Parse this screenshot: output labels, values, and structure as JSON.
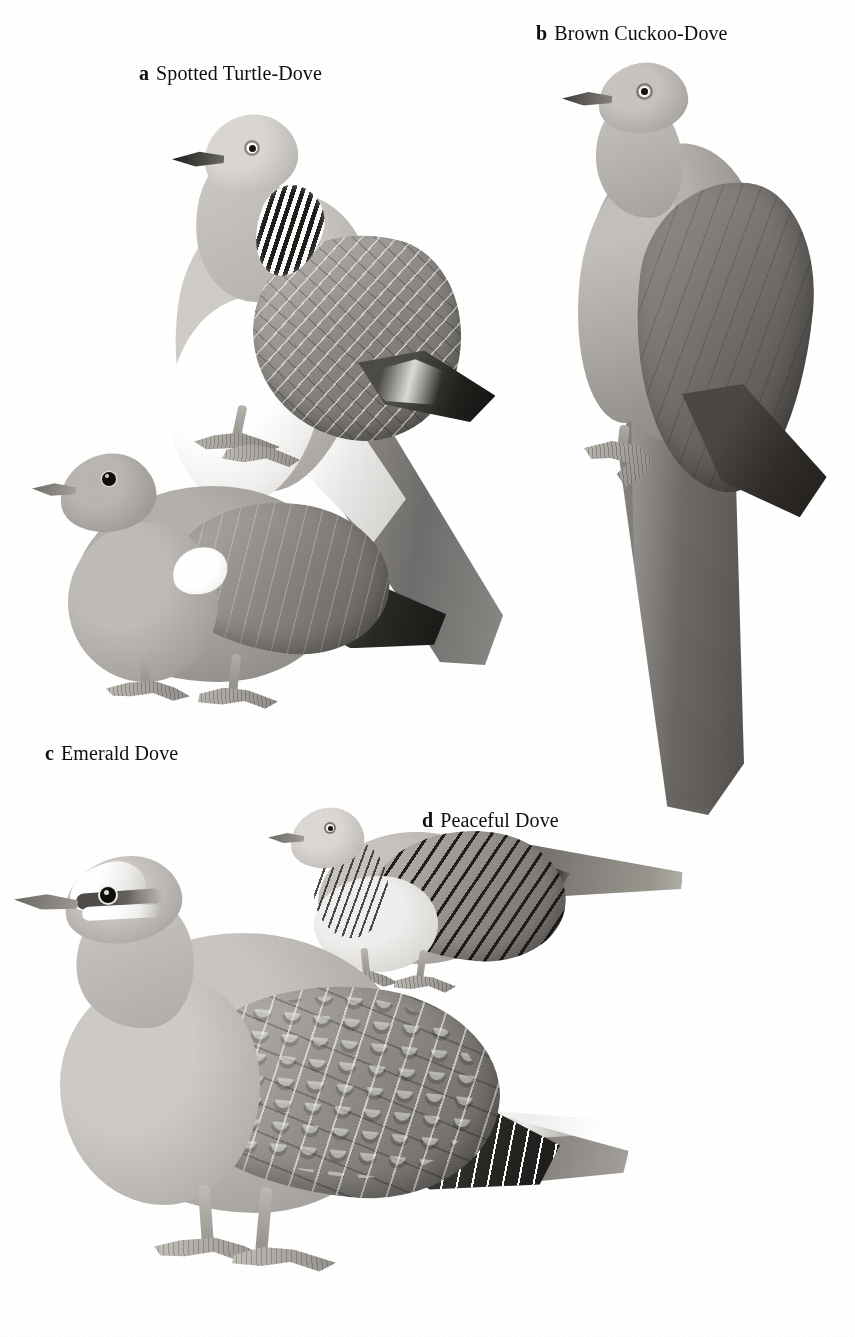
{
  "plate": {
    "background_color": "#ffffff",
    "medium": "field-guide illustration plate",
    "subject": "doves and pigeons",
    "width": 855,
    "height": 1337
  },
  "captions": [
    {
      "letter": "a",
      "name": "Spotted Turtle-Dove"
    },
    {
      "letter": "b",
      "name": "Brown Cuckoo-Dove"
    },
    {
      "letter": "c",
      "name": "Emerald Dove"
    },
    {
      "letter": "d",
      "name": "Peaceful Dove"
    }
  ],
  "figures": [
    {
      "key": "a",
      "label": "Spotted Turtle-Dove",
      "pose": "perched, facing left, long tail hanging down-right",
      "features": [
        "black-and-white chequered neck patch",
        "pale grey head with pale eye-ring",
        "scalloped grey-brown wing coverts",
        "blackish wing tip",
        "long graduated tail with white outer edge",
        "whitish belly and undertail"
      ],
      "palette": {
        "head": "#cfccc7",
        "body": "#b9b6b1",
        "wing": "#8f8c88",
        "wingtip": "#23211e",
        "belly": "#ffffff",
        "bill": "#1c1a17",
        "neck_patch_dark": "#191714",
        "neck_patch_light": "#ffffff"
      }
    },
    {
      "key": "b",
      "label": "Brown Cuckoo-Dove",
      "pose": "perched upright, facing left, extremely long broad tail",
      "features": [
        "plain unmarked plumage",
        "pale eye-ring with dark pupil",
        "slender dark bill",
        "uniform mid-grey-brown back and wing",
        "very long broad tail reaching the bottom of the figure",
        "gripping foot with curved claws"
      ],
      "palette": {
        "head": "#c7c4bf",
        "breast": "#c3c0bb",
        "wing": "#767370",
        "wingtip": "#2f2c29",
        "tail": "#6e6b67",
        "bill": "#3a3835"
      }
    },
    {
      "key": "c",
      "label": "Emerald Dove",
      "pose": "standing on ground, facing left, short tail",
      "features": [
        "large dark eye",
        "white shoulder patch on the folded wing",
        "short dark tail with a pale band",
        "rounded plump body",
        "pale pinkish-grey breast"
      ],
      "palette": {
        "head": "#b9b6b1",
        "body": "#9e9b96",
        "wing": "#8b8884",
        "shoulder_patch": "#ffffff",
        "tail": "#2b2926",
        "eye": "#100e0c"
      }
    },
    {
      "key": "d",
      "label": "Peaceful Dove",
      "pose": "standing, facing left, slim with long tapered tail",
      "features": [
        "fine dark barring on hindneck and breast",
        "boldly barred wing coverts",
        "pale eye with narrow eye-ring",
        "small slender body",
        "long tapering tail, dark at the base"
      ],
      "palette": {
        "head": "#dbd8d3",
        "body": "#aeaba6",
        "belly": "#dcdad7",
        "bars": "#211f1c",
        "tail": "#84817d"
      }
    },
    {
      "key": "e",
      "label": "Spotted Turtle-Dove",
      "pose": "large standing bird, lower part of plate, facing left",
      "features": [
        "white forehead and white supercilium",
        "dark eye-stripe through a dark eye",
        "large scalloped wing coverts with pale fringes",
        "blackish primaries with white fringes",
        "long tail with pale outer edge",
        "pale grey-pink underparts"
      ],
      "palette": {
        "forehead": "#ffffff",
        "head": "#b2afaa",
        "body": "#b2afaa",
        "wing": "#97948f",
        "primaries": "#2a2825",
        "tail": "#8a8783",
        "eye": "#100e0b"
      }
    }
  ]
}
